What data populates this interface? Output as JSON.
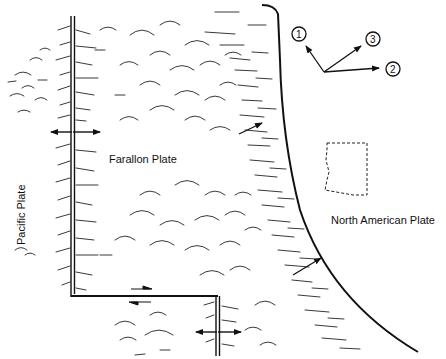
{
  "diagram": {
    "labels": {
      "pacific_plate": "Pacific Plate",
      "farallon_plate": "Farallon Plate",
      "north_american_plate": "North American Plate"
    },
    "compass_vectors": [
      {
        "id": "1",
        "label": "1"
      },
      {
        "id": "2",
        "label": "2"
      },
      {
        "id": "3",
        "label": "3"
      }
    ],
    "features": {
      "spreading_ridge": "double-line ridge with divergent arrows",
      "transform_fault": "offset with opposing half-arrows",
      "subduction_trench": "curved hatched boundary with convergence arrows",
      "arizona_outline": "dashed state outline"
    },
    "colors": {
      "ink": "#111111",
      "background": "#ffffff"
    }
  }
}
